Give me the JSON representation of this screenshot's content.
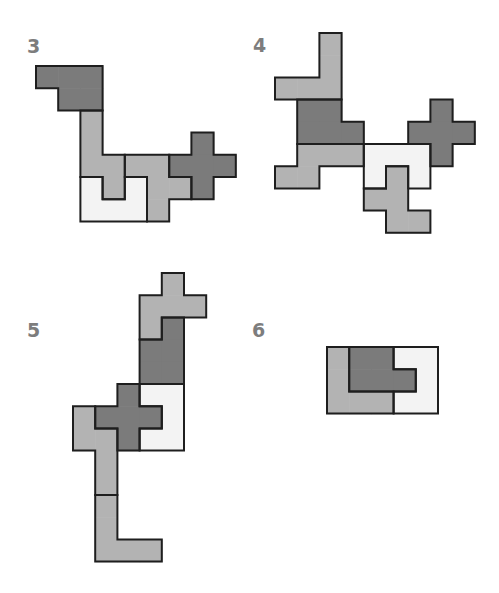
{
  "colors": {
    "dark": "#7b7b7b",
    "medium": "#b3b3b3",
    "light": "#f3f3f3",
    "border": "#1e1e1e",
    "label": "#7d7d7d"
  },
  "unit": 22.2,
  "figures": [
    {
      "label": "3",
      "label_pos": [
        27,
        37
      ],
      "origin": [
        36,
        66
      ],
      "pieces": [
        {
          "shade": "dark",
          "cells": [
            [
              0,
              0
            ],
            [
              1,
              0
            ],
            [
              2,
              0
            ],
            [
              1,
              1
            ],
            [
              2,
              1
            ]
          ]
        },
        {
          "shade": "medium",
          "cells": [
            [
              2,
              2
            ],
            [
              2,
              3
            ],
            [
              2,
              4
            ],
            [
              3,
              4
            ],
            [
              3,
              5
            ]
          ]
        },
        {
          "shade": "light",
          "cells": [
            [
              2,
              5
            ],
            [
              2,
              6
            ],
            [
              3,
              6
            ],
            [
              4,
              6
            ],
            [
              4,
              5
            ]
          ]
        },
        {
          "shade": "medium",
          "cells": [
            [
              4,
              4
            ],
            [
              5,
              4
            ],
            [
              5,
              5
            ],
            [
              5,
              6
            ],
            [
              6,
              5
            ]
          ]
        },
        {
          "shade": "dark",
          "cells": [
            [
              7,
              3
            ],
            [
              6,
              4
            ],
            [
              7,
              4
            ],
            [
              8,
              4
            ],
            [
              7,
              5
            ]
          ]
        }
      ]
    },
    {
      "label": "4",
      "label_pos": [
        253,
        36
      ],
      "origin": [
        275,
        33
      ],
      "pieces": [
        {
          "shade": "medium",
          "cells": [
            [
              2,
              0
            ],
            [
              2,
              1
            ],
            [
              0,
              2
            ],
            [
              1,
              2
            ],
            [
              2,
              2
            ]
          ]
        },
        {
          "shade": "dark",
          "cells": [
            [
              1,
              3
            ],
            [
              2,
              3
            ],
            [
              1,
              4
            ],
            [
              2,
              4
            ],
            [
              3,
              4
            ]
          ]
        },
        {
          "shade": "medium",
          "cells": [
            [
              1,
              5
            ],
            [
              2,
              5
            ],
            [
              3,
              5
            ],
            [
              0,
              6
            ],
            [
              1,
              6
            ]
          ]
        },
        {
          "shade": "light",
          "cells": [
            [
              4,
              5
            ],
            [
              5,
              5
            ],
            [
              6,
              5
            ],
            [
              4,
              6
            ],
            [
              6,
              6
            ]
          ]
        },
        {
          "shade": "medium",
          "cells": [
            [
              5,
              6
            ],
            [
              4,
              7
            ],
            [
              5,
              7
            ],
            [
              5,
              8
            ],
            [
              6,
              8
            ]
          ]
        },
        {
          "shade": "dark",
          "cells": [
            [
              7,
              3
            ],
            [
              6,
              4
            ],
            [
              7,
              4
            ],
            [
              8,
              4
            ],
            [
              7,
              5
            ]
          ]
        }
      ]
    },
    {
      "label": "5",
      "label_pos": [
        27,
        321
      ],
      "origin": [
        73,
        273
      ],
      "pieces": [
        {
          "shade": "medium",
          "cells": [
            [
              4,
              0
            ],
            [
              3,
              1
            ],
            [
              4,
              1
            ],
            [
              5,
              1
            ],
            [
              3,
              2
            ]
          ]
        },
        {
          "shade": "dark",
          "cells": [
            [
              4,
              2
            ],
            [
              3,
              3
            ],
            [
              4,
              3
            ],
            [
              3,
              4
            ],
            [
              4,
              4
            ]
          ]
        },
        {
          "shade": "light",
          "cells": [
            [
              3,
              5
            ],
            [
              4,
              5
            ],
            [
              4,
              6
            ],
            [
              3,
              7
            ],
            [
              4,
              7
            ]
          ]
        },
        {
          "shade": "medium",
          "cells": [
            [
              0,
              6
            ],
            [
              0,
              7
            ],
            [
              1,
              7
            ],
            [
              1,
              8
            ],
            [
              1,
              9
            ]
          ]
        },
        {
          "shade": "dark",
          "cells": [
            [
              2,
              5
            ],
            [
              1,
              6
            ],
            [
              2,
              6
            ],
            [
              3,
              6
            ],
            [
              2,
              7
            ]
          ]
        },
        {
          "shade": "medium",
          "cells": [
            [
              1,
              10
            ],
            [
              1,
              11
            ],
            [
              1,
              12
            ],
            [
              2,
              12
            ],
            [
              3,
              12
            ]
          ]
        }
      ]
    },
    {
      "label": "6",
      "label_pos": [
        252,
        321
      ],
      "origin": [
        327,
        347
      ],
      "pieces": [
        {
          "shade": "medium",
          "cells": [
            [
              0,
              0
            ],
            [
              0,
              1
            ],
            [
              0,
              2
            ],
            [
              1,
              2
            ],
            [
              2,
              2
            ]
          ]
        },
        {
          "shade": "dark",
          "cells": [
            [
              1,
              0
            ],
            [
              2,
              0
            ],
            [
              1,
              1
            ],
            [
              2,
              1
            ],
            [
              3,
              1
            ]
          ]
        },
        {
          "shade": "light",
          "cells": [
            [
              3,
              0
            ],
            [
              4,
              0
            ],
            [
              4,
              1
            ],
            [
              3,
              2
            ],
            [
              4,
              2
            ]
          ]
        }
      ]
    }
  ],
  "labels": {
    "fig3": "3",
    "fig4": "4",
    "fig5": "5",
    "fig6": "6"
  }
}
